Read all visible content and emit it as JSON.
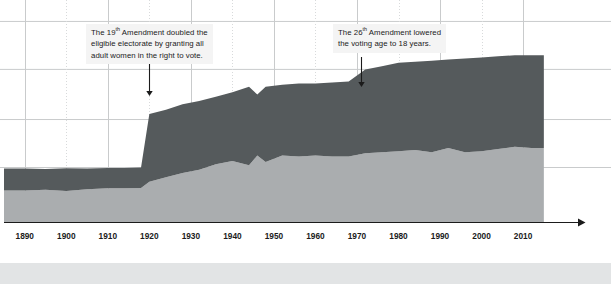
{
  "annotations": [
    {
      "id": "amendment-19",
      "lines": [
        "The 19th Amendment doubled the",
        "eligible electorate by granting all",
        "adult women in the right to vote."
      ],
      "line1_pre": "The 19",
      "line1_sup": "th",
      "line1_post": " Amendment doubled the",
      "line2": "eligible electorate by granting all",
      "line3": "adult women in the right to vote.",
      "arrow_year": 1920
    },
    {
      "id": "amendment-26",
      "line1_pre": "The 26",
      "line1_sup": "th",
      "line1_post": " Amendment lowered",
      "line2": "the voting age to 18 years.",
      "arrow_year": 1971
    }
  ],
  "colors": {
    "upper_area": "#555a5c",
    "lower_area": "#aaadaf",
    "axis": "#1b1b1b",
    "grid_solid": "#c9cbcc",
    "grid_dotted": "#d8dadb",
    "annotation_bg": "#f4f4f4",
    "text": "#1b1b1b",
    "bottom_band": "#e2e4e5",
    "page_bg": "#ffffff"
  },
  "chart_data": {
    "type": "area",
    "stacked": true,
    "title": "",
    "xlabel": "",
    "ylabel": "",
    "grid": true,
    "legend": "none",
    "xlim": [
      1885,
      2016
    ],
    "ylim": [
      0,
      100
    ],
    "xticks": [
      1890,
      1900,
      1910,
      1920,
      1930,
      1940,
      1950,
      1960,
      1970,
      1980,
      1990,
      2000,
      2010
    ],
    "xticklabels": [
      "1890",
      "1900",
      "1910",
      "1920",
      "1930",
      "1940",
      "1950",
      "1960",
      "1970",
      "1980",
      "1990",
      "2000",
      "2010"
    ],
    "yticks": [
      25,
      47,
      70,
      92
    ],
    "x": [
      1885,
      1890,
      1895,
      1900,
      1905,
      1910,
      1914,
      1918,
      1920,
      1924,
      1928,
      1932,
      1936,
      1940,
      1944,
      1946,
      1948,
      1952,
      1956,
      1960,
      1964,
      1968,
      1972,
      1976,
      1980,
      1984,
      1988,
      1992,
      1996,
      2000,
      2004,
      2008,
      2012,
      2015
    ],
    "series": [
      {
        "name": "Voted",
        "color": "#aaadaf",
        "values": [
          14.5,
          14.5,
          14.8,
          14.2,
          15.0,
          15.5,
          15.5,
          15.6,
          18.5,
          20.5,
          22.5,
          24.0,
          26.5,
          28.0,
          26.0,
          30.5,
          27.5,
          30.5,
          30.0,
          30.5,
          30.0,
          30.0,
          31.5,
          32.0,
          32.5,
          33.0,
          32.0,
          34.0,
          32.0,
          32.5,
          33.5,
          34.5,
          34.0,
          34.0
        ]
      },
      {
        "name": "Eligible but did not vote",
        "color": "#555a5c",
        "values": [
          10.0,
          10.0,
          9.5,
          10.5,
          9.5,
          9.3,
          9.3,
          9.4,
          31.0,
          31.0,
          31.5,
          31.5,
          31.0,
          31.5,
          36.0,
          28.0,
          34.5,
          32.5,
          33.5,
          33.0,
          34.0,
          34.5,
          38.5,
          39.5,
          40.5,
          40.5,
          42.0,
          40.5,
          43.0,
          43.0,
          42.5,
          42.0,
          42.5,
          42.5
        ]
      }
    ]
  }
}
